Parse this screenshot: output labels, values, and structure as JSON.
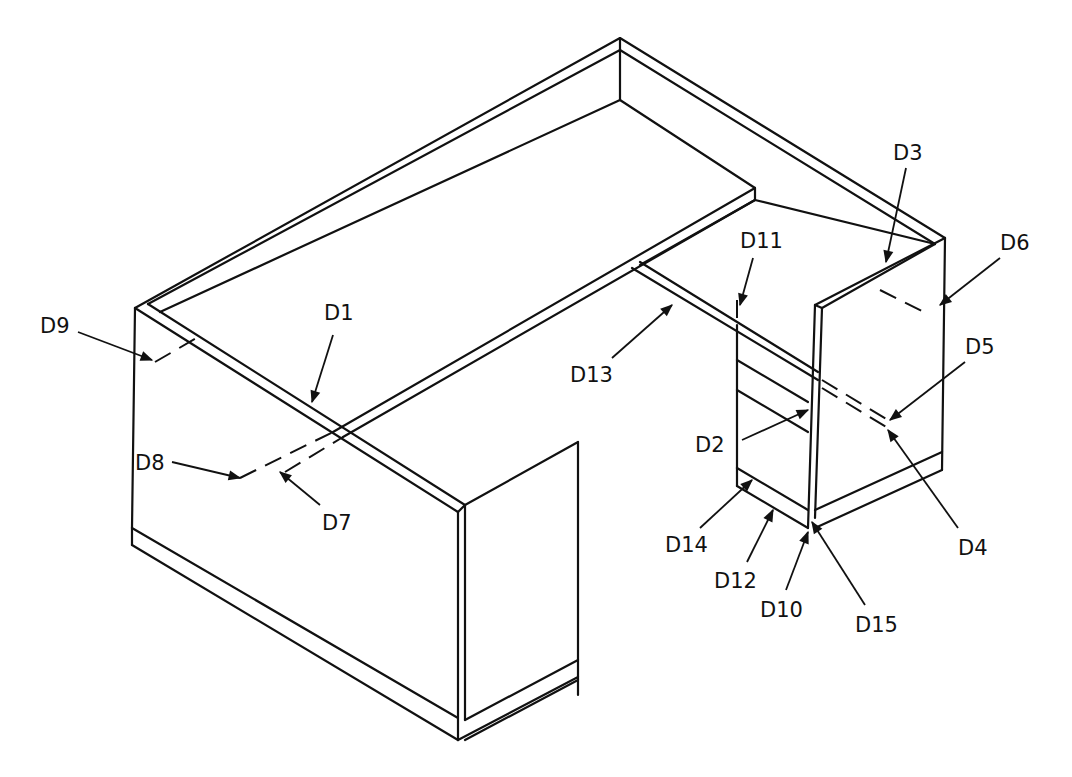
{
  "figure": {
    "labels": {
      "D1": "D1",
      "D2": "D2",
      "D3": "D3",
      "D4": "D4",
      "D5": "D5",
      "D6": "D6",
      "D7": "D7",
      "D8": "D8",
      "D9": "D9",
      "D10": "D10",
      "D11": "D11",
      "D12": "D12",
      "D13": "D13",
      "D14": "D14",
      "D15": "D15"
    }
  }
}
